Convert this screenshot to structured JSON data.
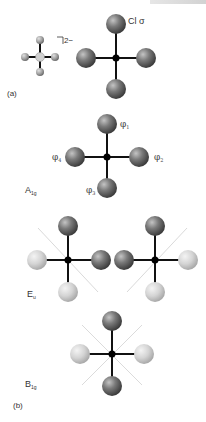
{
  "figure": {
    "panel_a": {
      "label": "(a)",
      "charge": "2−",
      "ligand_label": "Cl σ"
    },
    "panel_b": {
      "label": "(b)",
      "a1g": {
        "symmetry": "A",
        "symmetry_sub": "1g",
        "orbitals": [
          {
            "name": "φ",
            "sub": "1"
          },
          {
            "name": "φ",
            "sub": "2"
          },
          {
            "name": "φ",
            "sub": "3"
          },
          {
            "name": "φ",
            "sub": "4"
          }
        ]
      },
      "eu": {
        "symmetry": "E",
        "symmetry_sub": "u"
      },
      "b1g": {
        "symmetry": "B",
        "symmetry_sub": "1g"
      }
    },
    "colors": {
      "dark_lobe": "#6a6a6a",
      "light_lobe": "#d8d8d8",
      "bond": "#111111",
      "node_plane": "#c8c8c8"
    }
  }
}
